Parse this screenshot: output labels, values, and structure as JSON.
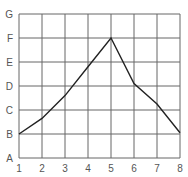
{
  "chart_data": {
    "type": "line",
    "title": "",
    "xlabel": "",
    "ylabel": "",
    "x": [
      1,
      2,
      3,
      4,
      5,
      6,
      7,
      8
    ],
    "x_tick_labels": [
      "1",
      "2",
      "3",
      "4",
      "5",
      "6",
      "7",
      "8"
    ],
    "y_tick_labels": [
      "A",
      "B",
      "C",
      "D",
      "E",
      "F",
      "G"
    ],
    "y_tick_values": [
      1,
      2,
      3,
      4,
      5,
      6,
      7
    ],
    "series": [
      {
        "name": "series-1",
        "values": [
          2.0,
          2.65,
          3.6,
          4.8,
          6.0,
          4.1,
          3.25,
          2.05
        ]
      }
    ],
    "xlim": [
      1,
      8
    ],
    "ylim": [
      1,
      7
    ],
    "grid": true,
    "legend": null,
    "colors": {
      "line": "#222222",
      "grid": "#666666",
      "tick_label": "#555555"
    }
  }
}
